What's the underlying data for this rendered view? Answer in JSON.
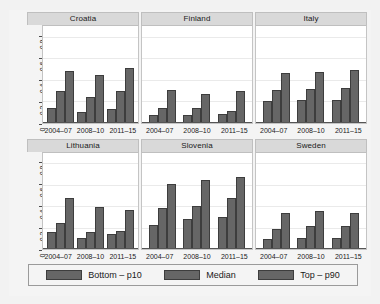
{
  "chart_data": {
    "type": "bar",
    "title": "",
    "xlabel": "",
    "ylabel": "",
    "ylim": [
      0,
      0.9
    ],
    "yticks": [
      0,
      0.2,
      0.4,
      0.6,
      0.8
    ],
    "ytick_labels": [
      "0",
      "0.2",
      "0.4",
      "0.6",
      "0.8"
    ],
    "grid": true,
    "legend_position": "bottom",
    "categories": [
      "2004–07",
      "2008–10",
      "2011–15"
    ],
    "series": [
      {
        "name": "Bottom – p10"
      },
      {
        "name": "Median"
      },
      {
        "name": "Top – p90"
      }
    ],
    "panels": [
      {
        "title": "Croatia",
        "categories": [
          "2004–07",
          "2008–10",
          "2011–15"
        ],
        "values": [
          [
            0.14,
            0.29,
            0.48
          ],
          [
            0.1,
            0.24,
            0.44
          ],
          [
            0.13,
            0.29,
            0.51
          ]
        ]
      },
      {
        "title": "Finland",
        "categories": [
          "2004–07",
          "2008–10",
          "2011–15"
        ],
        "values": [
          [
            0.07,
            0.14,
            0.3
          ],
          [
            0.07,
            0.14,
            0.27
          ],
          [
            0.08,
            0.11,
            0.29
          ]
        ]
      },
      {
        "title": "Italy",
        "categories": [
          "2004–07",
          "2008–10",
          "2011–15"
        ],
        "values": [
          [
            0.2,
            0.3,
            0.46
          ],
          [
            0.21,
            0.31,
            0.47
          ],
          [
            0.21,
            0.32,
            0.49
          ]
        ]
      },
      {
        "title": "Lithuania",
        "categories": [
          "2004–07",
          "2008–10",
          "2011–15"
        ],
        "values": [
          [
            0.16,
            0.24,
            0.48
          ],
          [
            0.1,
            0.16,
            0.39
          ],
          [
            0.14,
            0.17,
            0.36
          ]
        ]
      },
      {
        "title": "Slovenia",
        "categories": [
          "2004–07",
          "2008–10",
          "2011–15"
        ],
        "values": [
          [
            0.22,
            0.38,
            0.61
          ],
          [
            0.28,
            0.4,
            0.64
          ],
          [
            0.3,
            0.48,
            0.67
          ]
        ]
      },
      {
        "title": "Sweden",
        "categories": [
          "2004–07",
          "2008–10",
          "2011–15"
        ],
        "values": [
          [
            0.09,
            0.19,
            0.34
          ],
          [
            0.1,
            0.21,
            0.35
          ],
          [
            0.1,
            0.21,
            0.34
          ]
        ]
      }
    ],
    "colors": {
      "bar_fill": "#666666",
      "bar_border": "#3d3d3d",
      "panel_strip": "#d9d9d9",
      "plot_background": "#ffffff",
      "figure_background": "#f4f4f4",
      "gridline": "#eaeaea"
    }
  }
}
